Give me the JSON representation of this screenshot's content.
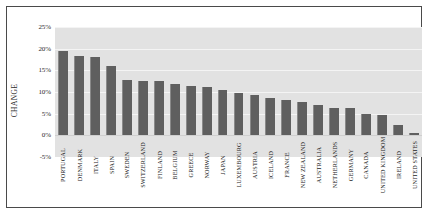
{
  "chart_data": {
    "type": "bar",
    "title": "",
    "xlabel": "",
    "ylabel": "CHANGE",
    "ylim": [
      -5,
      25
    ],
    "ytick_labels": [
      "25%",
      "20%",
      "15%",
      "10%",
      "5%",
      "0%",
      "-5%"
    ],
    "ytick_values": [
      25,
      20,
      15,
      10,
      5,
      0,
      -5
    ],
    "grid": true,
    "legend": "none",
    "orientation": "vertical",
    "categories": [
      "PORTUGAL",
      "DENMARK",
      "ITALY",
      "SPAIN",
      "SWEDEN",
      "SWITZERLAND",
      "FINLAND",
      "BELGIUM",
      "GREECE",
      "NORWAY",
      "JAPAN",
      "LUXEMBOURG",
      "AUSTRIA",
      "ICELAND",
      "FRANCE",
      "NEW ZEALAND",
      "AUSTRALIA",
      "NETHERLANDS",
      "GERMANY",
      "CANADA",
      "UNITED KINGDOM",
      "IRELAND",
      "UNITED STATES"
    ],
    "values": [
      19.5,
      18.3,
      18.0,
      16.0,
      12.8,
      12.6,
      12.6,
      11.8,
      11.3,
      11.2,
      10.4,
      9.7,
      9.3,
      8.6,
      8.2,
      7.6,
      7.0,
      6.4,
      6.2,
      5.0,
      4.8,
      2.4,
      0.5
    ]
  },
  "axis": {
    "y_title": "CHANGE"
  }
}
